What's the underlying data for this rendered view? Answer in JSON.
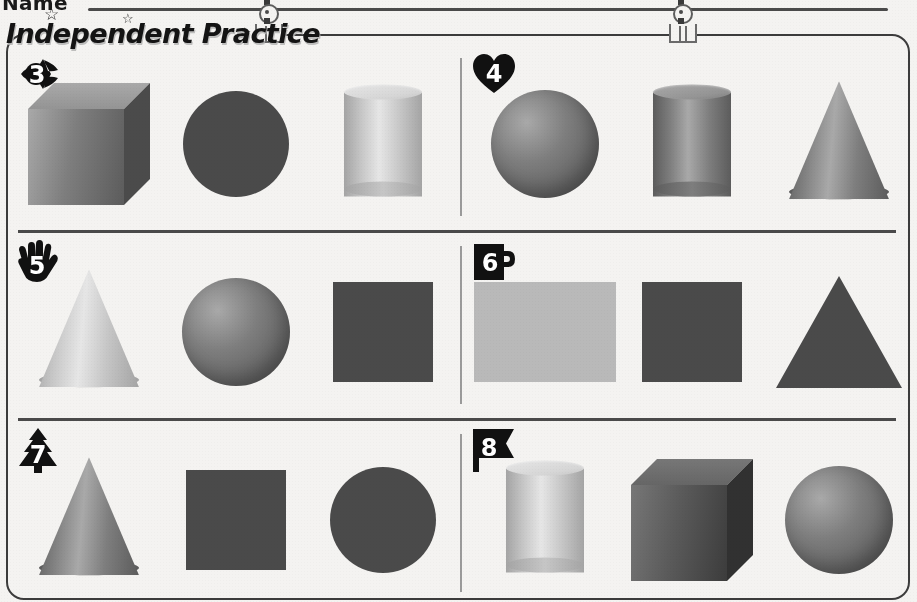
{
  "header": {
    "name_label": "Name",
    "title": "Independent Practice",
    "stars": [
      "star",
      "star",
      "star"
    ],
    "clips": [
      "binder-clip",
      "binder-clip"
    ]
  },
  "colors": {
    "page_bg": "#f4f3f1",
    "ink": "#3c3c3c",
    "rule": "#4a4a4a",
    "divider": "#9a9a9a",
    "badge_fill": "#111111",
    "badge_text": "#ffffff",
    "shape_mid_gray": "#7c7c7c",
    "shape_dark_gray": "#5a5a5a",
    "shape_light_gray": "#c9c9c9",
    "shape_very_dark": "#3e3e3e"
  },
  "problems": [
    {
      "number": "3",
      "badge_shape": "fish",
      "shapes": [
        {
          "name": "cube",
          "dimension": "3D",
          "tone": "mid"
        },
        {
          "name": "circle",
          "dimension": "2D",
          "tone": "dark"
        },
        {
          "name": "cylinder",
          "dimension": "3D",
          "tone": "light"
        }
      ]
    },
    {
      "number": "4",
      "badge_shape": "heart",
      "shapes": [
        {
          "name": "sphere",
          "dimension": "3D",
          "tone": "mid"
        },
        {
          "name": "cylinder",
          "dimension": "3D",
          "tone": "mid"
        },
        {
          "name": "cone",
          "dimension": "3D",
          "tone": "mid"
        }
      ]
    },
    {
      "number": "5",
      "badge_shape": "hand",
      "shapes": [
        {
          "name": "cone",
          "dimension": "3D",
          "tone": "light"
        },
        {
          "name": "sphere",
          "dimension": "3D",
          "tone": "mid"
        },
        {
          "name": "square",
          "dimension": "2D",
          "tone": "dark"
        }
      ]
    },
    {
      "number": "6",
      "badge_shape": "mug",
      "shapes": [
        {
          "name": "rectangle",
          "dimension": "2D",
          "tone": "light"
        },
        {
          "name": "square",
          "dimension": "2D",
          "tone": "dark"
        },
        {
          "name": "triangle",
          "dimension": "2D",
          "tone": "dark"
        }
      ]
    },
    {
      "number": "7",
      "badge_shape": "tree",
      "shapes": [
        {
          "name": "cone",
          "dimension": "3D",
          "tone": "mid"
        },
        {
          "name": "square",
          "dimension": "2D",
          "tone": "dark"
        },
        {
          "name": "circle",
          "dimension": "2D",
          "tone": "dark"
        }
      ]
    },
    {
      "number": "8",
      "badge_shape": "flag",
      "shapes": [
        {
          "name": "cylinder",
          "dimension": "3D",
          "tone": "light"
        },
        {
          "name": "cube",
          "dimension": "3D",
          "tone": "dark"
        },
        {
          "name": "sphere",
          "dimension": "3D",
          "tone": "mid"
        }
      ]
    }
  ]
}
